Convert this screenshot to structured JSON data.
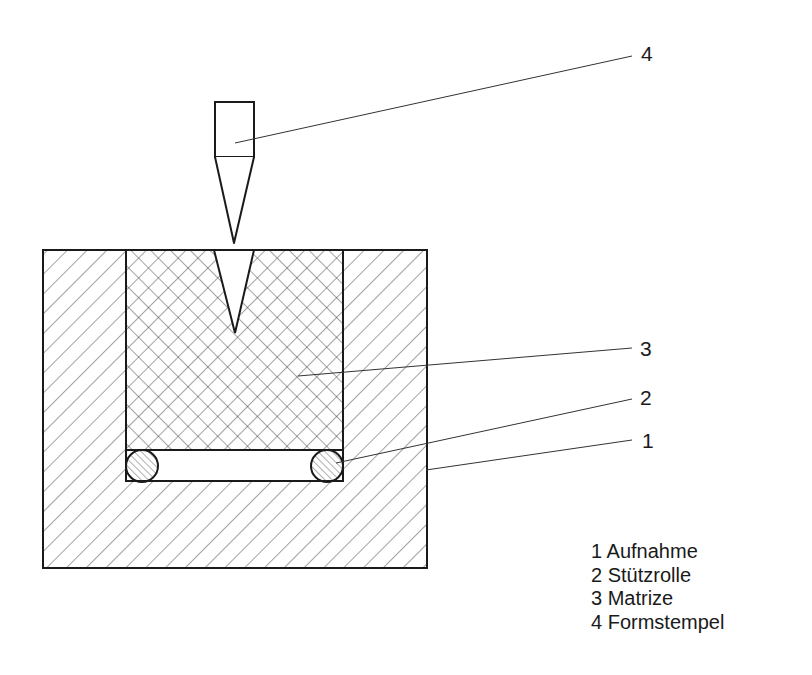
{
  "diagram": {
    "title": "",
    "callouts": [
      {
        "number": "4",
        "x": 641,
        "y": 43
      },
      {
        "number": "3",
        "x": 640,
        "y": 338
      },
      {
        "number": "2",
        "x": 640,
        "y": 387
      },
      {
        "number": "1",
        "x": 642,
        "y": 430
      }
    ],
    "legend": [
      {
        "number": "1",
        "label": "Aufnahme",
        "text": "1 Aufnahme"
      },
      {
        "number": "2",
        "label": "Stützrolle",
        "text": "2 Stützrolle"
      },
      {
        "number": "3",
        "label": "Matrize",
        "text": "3 Matrize"
      },
      {
        "number": "4",
        "label": "Formstempel",
        "text": "4 Formstempel"
      }
    ],
    "parts": {
      "aufnahme": {
        "id": 1,
        "hatch": "diagonal"
      },
      "stuetzrolle": {
        "id": 2,
        "hatch": "diagonal-fine",
        "count": 2
      },
      "matrize": {
        "id": 3,
        "hatch": "crosshatch"
      },
      "formstempel": {
        "id": 4,
        "hatch": "none"
      }
    },
    "colors": {
      "line": "#1a1a1a",
      "hatch": "#333333",
      "background": "#ffffff"
    }
  }
}
